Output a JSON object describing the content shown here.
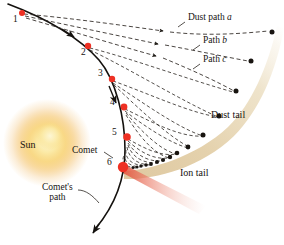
{
  "figure": {
    "width": 284,
    "height": 245,
    "background": "#ffffff"
  },
  "colors": {
    "comet_path": "#14110e",
    "marker_red": "#ee3124",
    "marker_red_dark": "#c42a1c",
    "dust_band": "#e3cfa8",
    "dust_band_light": "#efe2c8",
    "ion_tail": "#e8705c",
    "sun_core": "#fdf0c0",
    "sun_mid": "#f4c04a",
    "sun_outer": "#f0a830",
    "dashed_line": "#2a2520",
    "text": "#16120f"
  },
  "labels": {
    "sun": "Sun",
    "comet": "Comet",
    "comet_path_line1": "Comet's",
    "comet_path_line2": "path",
    "dust_tail": "Dust tail",
    "ion_tail": "Ion tail",
    "dust_path_a_prefix": "Dust path ",
    "dust_path_a_letter": "a",
    "path_b_prefix": "Path ",
    "path_b_letter": "b",
    "path_c_prefix": "Path ",
    "path_c_letter": "c"
  },
  "comet_positions": [
    {
      "id": "1",
      "label": "1",
      "x": 22,
      "y": 13,
      "r": 3.0,
      "label_x": 13,
      "label_y": 17
    },
    {
      "id": "2",
      "label": "2",
      "x": 88,
      "y": 46,
      "r": 3.2,
      "label_x": 82,
      "label_y": 50
    },
    {
      "id": "3",
      "label": "3",
      "x": 112,
      "y": 79,
      "r": 3.2,
      "label_x": 99,
      "label_y": 72
    },
    {
      "id": "4",
      "label": "4",
      "x": 124,
      "y": 107,
      "r": 3.4,
      "label_x": 111,
      "label_y": 101
    },
    {
      "id": "5",
      "label": "5",
      "x": 127,
      "y": 137,
      "r": 3.8,
      "label_x": 113,
      "label_y": 131
    },
    {
      "id": "6",
      "label": "6",
      "x": 123,
      "y": 167,
      "r": 5.2,
      "label_x": 108,
      "label_y": 161
    }
  ],
  "dust_paths": [
    {
      "name": "dust-path-a",
      "label": "Dust path a",
      "arrow_x": 167,
      "arrow_y": 31
    },
    {
      "name": "path-b",
      "label": "Path b",
      "arrow_x": 162,
      "arrow_y": 44
    },
    {
      "name": "path-c",
      "label": "Path c",
      "arrow_x": 160,
      "arrow_y": 56
    }
  ],
  "dust_tail_grains": [
    {
      "x": 272,
      "y": 32
    },
    {
      "x": 251,
      "y": 61
    },
    {
      "x": 236,
      "y": 91
    },
    {
      "x": 219,
      "y": 116
    },
    {
      "x": 203,
      "y": 135
    },
    {
      "x": 188,
      "y": 147
    },
    {
      "x": 177,
      "y": 153
    },
    {
      "x": 170,
      "y": 157
    },
    {
      "x": 163,
      "y": 160
    },
    {
      "x": 157,
      "y": 162
    },
    {
      "x": 151,
      "y": 164
    },
    {
      "x": 146,
      "y": 165
    },
    {
      "x": 141,
      "y": 166
    },
    {
      "x": 137,
      "y": 167
    },
    {
      "x": 133,
      "y": 167.5
    }
  ],
  "annotations": {
    "sun_label_x": 20,
    "sun_label_y": 145,
    "comet_label_x": 72,
    "comet_label_y": 147,
    "comet_path_label_x": 42,
    "comet_path_label_y": 188,
    "dust_tail_label_x": 211,
    "dust_tail_label_y": 116,
    "ion_tail_label_x": 180,
    "ion_tail_label_y": 174,
    "dust_path_a_x": 188,
    "dust_path_a_y": 19,
    "path_b_x": 203,
    "path_b_y": 42,
    "path_c_x": 203,
    "path_c_y": 61
  }
}
